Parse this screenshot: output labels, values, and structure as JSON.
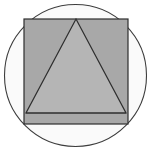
{
  "figure": {
    "canvas": {
      "width": 151,
      "height": 151,
      "background_color": "#ffffff"
    },
    "shapes": [
      {
        "name": "circle",
        "label": "Circle",
        "center_x": 75.5,
        "center_y": 75.5,
        "radius": 71,
        "fill_color": "#fafafa",
        "stroke_color": "#3d3d3d",
        "stroke_width": 1.1
      },
      {
        "name": "square",
        "label": "Square",
        "x": 24,
        "y": 19,
        "width": 104,
        "height": 105,
        "fill_color": "#a8a8a8",
        "stroke_color": "#2e2e2e",
        "stroke_width": 1.2
      },
      {
        "name": "triangle",
        "label": "Triangle",
        "points": "76,19 126,113 26,113",
        "apex_x": 76,
        "apex_y": 19,
        "base_left_x": 26,
        "base_left_y": 113,
        "base_right_x": 126,
        "base_right_y": 113,
        "fill_color": "#b5b5b5",
        "stroke_color": "#2e2e2e",
        "stroke_width": 1.2
      }
    ]
  }
}
